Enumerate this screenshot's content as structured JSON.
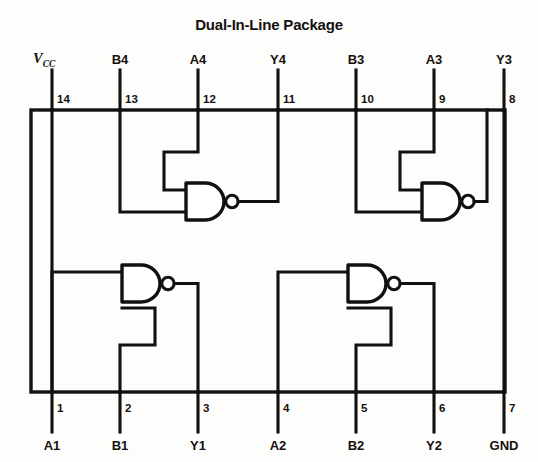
{
  "title": "Dual-In-Line Package",
  "package": {
    "type": "DIP-14",
    "note": "Quad 2-input NAND gate pinout"
  },
  "pins": {
    "top": [
      {
        "number": "14",
        "signal": "Vcc",
        "signal_base": "V",
        "signal_sub": "CC",
        "x": 52
      },
      {
        "number": "13",
        "signal": "B4",
        "x": 120
      },
      {
        "number": "12",
        "signal": "A4",
        "x": 198
      },
      {
        "number": "11",
        "signal": "Y4",
        "x": 278
      },
      {
        "number": "10",
        "signal": "B3",
        "x": 356
      },
      {
        "number": "9",
        "signal": "A3",
        "x": 434
      },
      {
        "number": "8",
        "signal": "Y3",
        "x": 504
      }
    ],
    "bottom": [
      {
        "number": "1",
        "signal": "A1",
        "x": 52
      },
      {
        "number": "2",
        "signal": "B1",
        "x": 120
      },
      {
        "number": "3",
        "signal": "Y1",
        "x": 198
      },
      {
        "number": "4",
        "signal": "A2",
        "x": 278
      },
      {
        "number": "5",
        "signal": "B2",
        "x": 356
      },
      {
        "number": "6",
        "signal": "Y2",
        "x": 434
      },
      {
        "number": "7",
        "signal": "GND",
        "x": 504
      }
    ]
  },
  "gates": [
    {
      "id": "gate4",
      "type": "NAND",
      "inputs": [
        "A4",
        "B4"
      ],
      "output": "Y4",
      "position": "upper-left"
    },
    {
      "id": "gate3",
      "type": "NAND",
      "inputs": [
        "A3",
        "B3"
      ],
      "output": "Y3",
      "position": "upper-right"
    },
    {
      "id": "gate1",
      "type": "NAND",
      "inputs": [
        "A1",
        "B1"
      ],
      "output": "Y1",
      "position": "lower-left"
    },
    {
      "id": "gate2",
      "type": "NAND",
      "inputs": [
        "A2",
        "B2"
      ],
      "output": "Y2",
      "position": "lower-right"
    }
  ],
  "colors": {
    "ink": "#121110",
    "paper": "#fdfdfc"
  }
}
